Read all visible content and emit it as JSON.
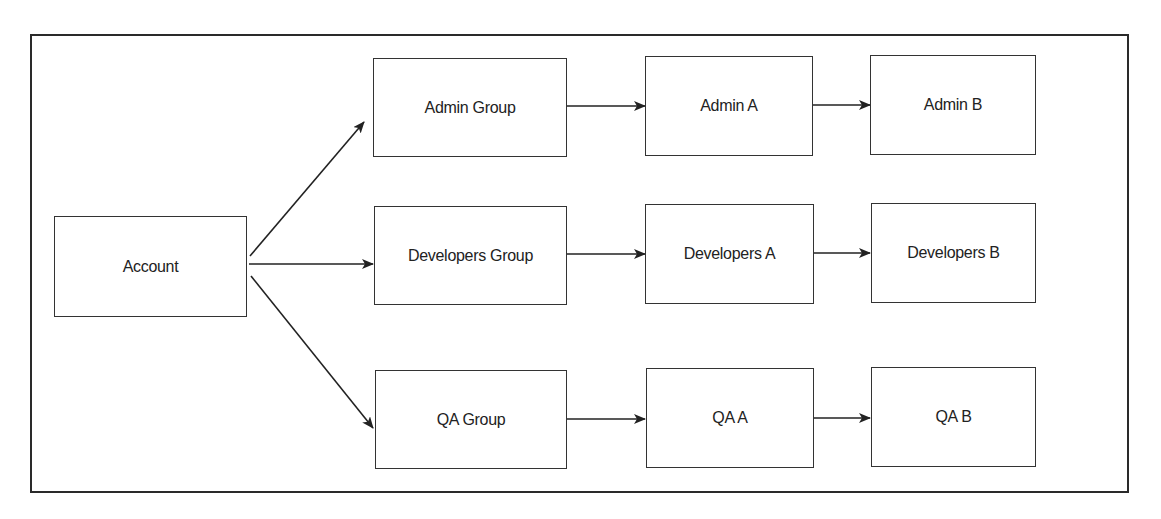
{
  "diagram": {
    "nodes": {
      "account": "Account",
      "admin_group": "Admin Group",
      "admin_a": "Admin A",
      "admin_b": "Admin B",
      "dev_group": "Developers Group",
      "dev_a": "Developers A",
      "dev_b": "Developers B",
      "qa_group": "QA Group",
      "qa_a": "QA A",
      "qa_b": "QA B"
    },
    "edges": [
      [
        "Account",
        "Admin Group"
      ],
      [
        "Account",
        "Developers Group"
      ],
      [
        "Account",
        "QA Group"
      ],
      [
        "Admin Group",
        "Admin A"
      ],
      [
        "Admin A",
        "Admin B"
      ],
      [
        "Developers Group",
        "Developers A"
      ],
      [
        "Developers A",
        "Developers B"
      ],
      [
        "QA Group",
        "QA A"
      ],
      [
        "QA A",
        "QA B"
      ]
    ]
  }
}
